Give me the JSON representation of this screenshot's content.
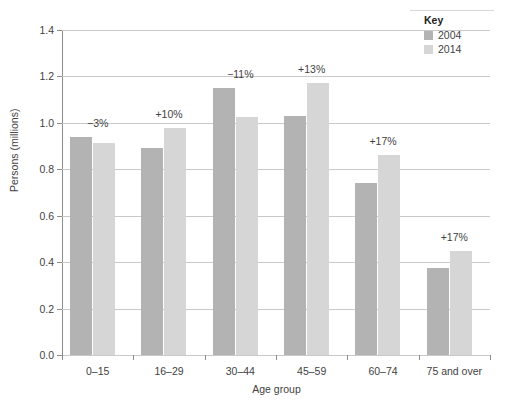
{
  "chart_data": {
    "type": "bar",
    "title": "",
    "xlabel": "Age group",
    "ylabel": "Persons (millions)",
    "ylim": [
      0.0,
      1.4
    ],
    "ytick_labels": [
      "0.0",
      "0.2",
      "0.4",
      "0.6",
      "0.8",
      "1.0",
      "1.2",
      "1.4"
    ],
    "ytick_values": [
      0.0,
      0.2,
      0.4,
      0.6,
      0.8,
      1.0,
      1.2,
      1.4
    ],
    "grid": "horizontal",
    "legend_position": "top-right",
    "categories": [
      "0–15",
      "16–29",
      "30–44",
      "45–59",
      "60–74",
      "75 and over"
    ],
    "series": [
      {
        "name": "2004",
        "color": "#b3b3b3",
        "values": [
          0.94,
          0.89,
          1.15,
          1.03,
          0.74,
          0.375
        ]
      },
      {
        "name": "2014",
        "color": "#d6d6d6",
        "values": [
          0.915,
          0.98,
          1.025,
          1.17,
          0.86,
          0.45
        ]
      }
    ],
    "annotations": [
      "−3%",
      "+10%",
      "−11%",
      "+13%",
      "+17%",
      "+17%"
    ]
  },
  "legend": {
    "title": "Key"
  }
}
